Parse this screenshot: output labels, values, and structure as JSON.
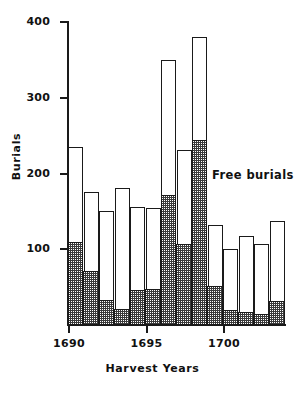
{
  "chart_data": {
    "type": "bar",
    "title": "",
    "subtitle": "",
    "xlabel": "Harvest Years",
    "ylabel": "Burials",
    "stacked": true,
    "grid": false,
    "legend_position": "inline-annotation",
    "ylim": [
      0,
      400
    ],
    "yticks": [
      100,
      200,
      300,
      400
    ],
    "ytick_labels": [
      "100",
      "200",
      "300",
      "400"
    ],
    "xlim": [
      1689.5,
      1703.5
    ],
    "xticks": [
      1690,
      1695,
      1700
    ],
    "xtick_labels": [
      "1690",
      "1695",
      "1700"
    ],
    "categories": [
      1690,
      1691,
      1692,
      1693,
      1694,
      1695,
      1696,
      1697,
      1698,
      1699,
      1700,
      1701,
      1702,
      1703
    ],
    "annotations": [
      {
        "text": "Free burials",
        "x": 1700,
        "y": 200
      }
    ],
    "series": [
      {
        "name": "Free burials",
        "style": "stippled",
        "values": [
          110,
          72,
          33,
          22,
          47,
          48,
          172,
          107,
          245,
          52,
          20,
          18,
          15,
          32
        ]
      },
      {
        "name": "Other burials",
        "style": "open",
        "values": [
          125,
          103,
          117,
          159,
          109,
          106,
          178,
          124,
          135,
          80,
          81,
          99,
          92,
          105
        ]
      }
    ],
    "totals": [
      235,
      175,
      150,
      181,
      156,
      154,
      350,
      231,
      380,
      132,
      101,
      117,
      107,
      137
    ]
  },
  "axis": {
    "x_title": "Harvest Years",
    "y_title": "Burials"
  }
}
